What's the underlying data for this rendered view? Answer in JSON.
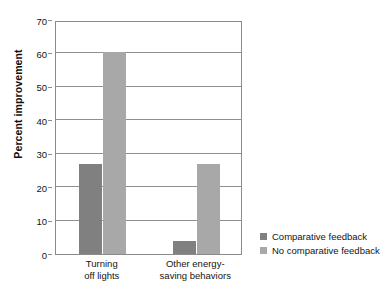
{
  "figure": {
    "title_cropped": "",
    "background": "#ffffff"
  },
  "chart_data": {
    "type": "bar",
    "title": "",
    "xlabel": "",
    "ylabel": "Percent improvement",
    "categories": [
      "Turning off lights",
      "Other energy-saving behaviors"
    ],
    "category_lines": [
      [
        "Turning",
        "off lights"
      ],
      [
        "Other energy-",
        "saving behaviors"
      ]
    ],
    "series": [
      {
        "name": "Comparative feedback",
        "color": "#808080",
        "values": [
          27,
          4
        ]
      },
      {
        "name": "No comparative feedback",
        "color": "#a8a8a8",
        "values": [
          60.5,
          27
        ]
      }
    ],
    "ylim": [
      0,
      70
    ],
    "yticks": [
      0,
      10,
      20,
      30,
      40,
      50,
      60,
      70
    ],
    "ytick_labels": [
      "0",
      "10",
      "20",
      "30",
      "40",
      "50",
      "60",
      "70"
    ],
    "grid": "horizontal",
    "legend_position": "right"
  },
  "legend": {
    "entries": [
      {
        "label": "Comparative feedback",
        "color": "#808080"
      },
      {
        "label": "No comparative feedback",
        "color": "#a8a8a8"
      }
    ]
  }
}
